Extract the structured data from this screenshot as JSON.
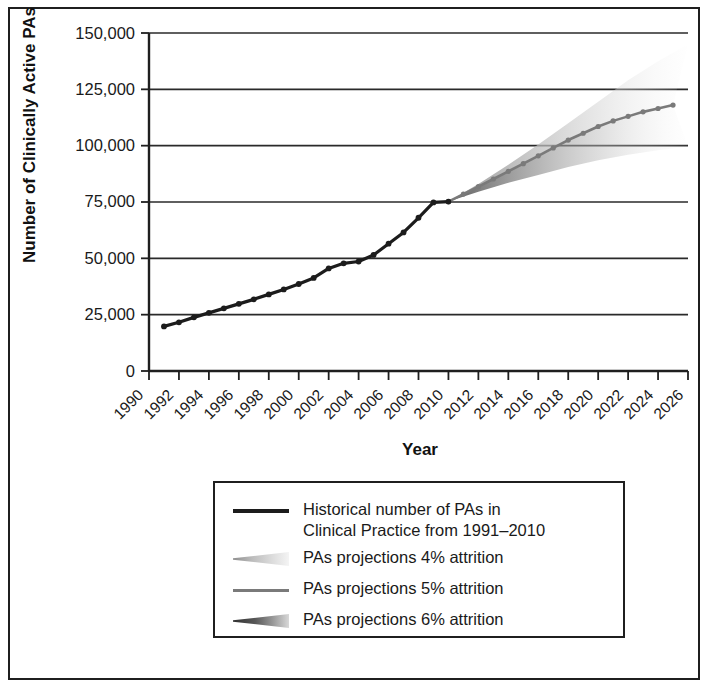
{
  "chart_data": {
    "type": "line",
    "title": "",
    "xlabel": "Year",
    "ylabel": "Number of Clinically Active PAs",
    "xlim": [
      1990,
      2026
    ],
    "ylim": [
      0,
      150000
    ],
    "grid": true,
    "legend_position": "below",
    "y_ticks": [
      0,
      25000,
      50000,
      75000,
      100000,
      125000,
      150000
    ],
    "y_tick_labels": [
      "0",
      "25,000",
      "50,000",
      "75,000",
      "100,000",
      "125,000",
      "150,000"
    ],
    "x_ticks": [
      1990,
      1992,
      1994,
      1996,
      1998,
      2000,
      2002,
      2004,
      2006,
      2008,
      2010,
      2012,
      2014,
      2016,
      2018,
      2020,
      2022,
      2024,
      2026
    ],
    "x_tick_labels": [
      "1990",
      "1992",
      "1994",
      "1996",
      "1998",
      "2000",
      "2002",
      "2004",
      "2006",
      "2008",
      "2010",
      "2012",
      "2014",
      "2016",
      "2018",
      "2020",
      "2022",
      "2024",
      "2026"
    ],
    "series": [
      {
        "name": "Historical number of PAs in Clinical Practice from 1991–2010",
        "style": "solid-black-markers",
        "color": "#1c1c1c",
        "x": [
          1991,
          1992,
          1993,
          1994,
          1995,
          1996,
          1997,
          1998,
          1999,
          2000,
          2001,
          2002,
          2003,
          2004,
          2005,
          2006,
          2007,
          2008,
          2009,
          2010
        ],
        "values": [
          19800,
          21600,
          23800,
          25800,
          27800,
          29800,
          31800,
          34000,
          36200,
          38600,
          41300,
          45500,
          47800,
          48600,
          51500,
          56500,
          61500,
          68000,
          74800,
          75200
        ]
      },
      {
        "name": "PAs projections 4% attrition",
        "style": "taper-light",
        "color": "#c8c8c8",
        "x": [
          2010,
          2012,
          2014,
          2016,
          2018,
          2020,
          2022,
          2024,
          2026
        ],
        "values": [
          75200,
          83000,
          91500,
          100500,
          110000,
          119500,
          129000,
          137500,
          145000
        ]
      },
      {
        "name": "PAs projections 5% attrition",
        "style": "solid-gray-markers",
        "color": "#7a7a7a",
        "x": [
          2010,
          2011,
          2012,
          2013,
          2014,
          2015,
          2016,
          2017,
          2018,
          2019,
          2020,
          2021,
          2022,
          2023,
          2024,
          2025
        ],
        "values": [
          75200,
          78500,
          81800,
          85200,
          88600,
          92000,
          95500,
          99000,
          102500,
          105500,
          108500,
          111000,
          113000,
          115000,
          116500,
          118000
        ]
      },
      {
        "name": "PAs projections 6% attrition",
        "style": "taper-dark",
        "color": "#4a4a4a",
        "x": [
          2010,
          2012,
          2014,
          2016,
          2018,
          2020,
          2022,
          2024,
          2026
        ],
        "values": [
          75200,
          79500,
          83500,
          87000,
          90500,
          93500,
          96000,
          98000,
          99500
        ]
      }
    ]
  },
  "axis": {
    "ylabel": "Number of Clinically Active PAs",
    "xlabel": "Year",
    "y_tick_labels": [
      "150,000",
      "125,000",
      "100,000",
      "75,000",
      "50,000",
      "25,000",
      "0"
    ],
    "x_tick_labels": [
      "1990",
      "1992",
      "1994",
      "1996",
      "1998",
      "2000",
      "2002",
      "2004",
      "2006",
      "2008",
      "2010",
      "2012",
      "2014",
      "2016",
      "2018",
      "2020",
      "2022",
      "2024",
      "2026"
    ]
  },
  "legend": {
    "items": [
      {
        "swatch": "solid-black",
        "label": "Historical number of PAs in\nClinical Practice from 1991–2010"
      },
      {
        "swatch": "taper-light",
        "label": "PAs projections 4% attrition"
      },
      {
        "swatch": "solid-gray",
        "label": "PAs projections 5% attrition"
      },
      {
        "swatch": "taper-dark",
        "label": "PAs projections 6% attrition"
      }
    ]
  },
  "colors": {
    "historical": "#1c1c1c",
    "projection_4": "#c8c8c8",
    "projection_5": "#7a7a7a",
    "projection_6": "#4a4a4a",
    "frame": "#1f1f1f",
    "background": "#ffffff"
  }
}
